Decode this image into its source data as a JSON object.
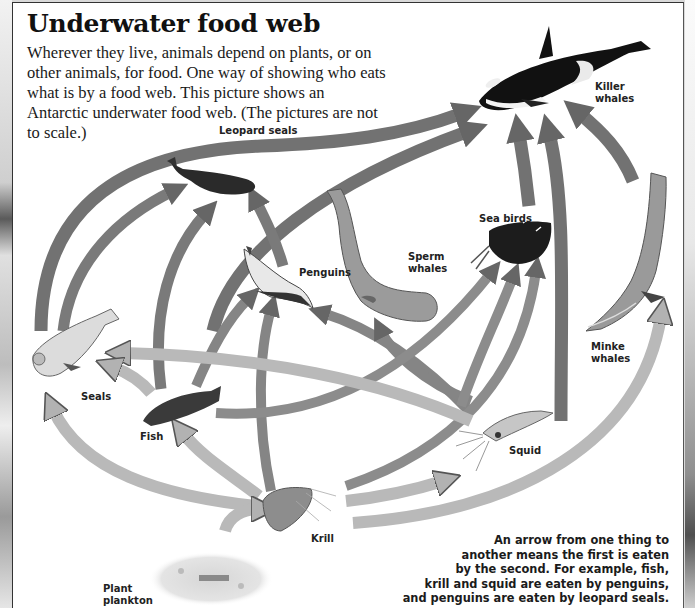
{
  "header": {
    "title": "Underwater food web",
    "intro": "Wherever they live, animals depend on plants, or on other animals, for food. One way of showing who eats what is by a food web. This picture shows an Antarctic underwater food web. (The pictures are not to scale.)"
  },
  "organisms": {
    "killer_whales": {
      "label_line1": "Killer",
      "label_line2": "whales",
      "icon": "killer-whale-icon"
    },
    "leopard_seals": {
      "label": "Leopard seals",
      "icon": "leopard-seal-icon"
    },
    "sea_birds": {
      "label": "Sea birds",
      "icon": "sea-bird-icon"
    },
    "sperm_whales": {
      "label_line1": "Sperm",
      "label_line2": "whales",
      "icon": "sperm-whale-icon"
    },
    "penguins": {
      "label": "Penguins",
      "icon": "penguin-icon"
    },
    "minke_whales": {
      "label_line1": "Minke",
      "label_line2": "whales",
      "icon": "minke-whale-icon"
    },
    "seals": {
      "label": "Seals",
      "icon": "seal-icon"
    },
    "fish": {
      "label": "Fish",
      "icon": "fish-icon"
    },
    "squid": {
      "label": "Squid",
      "icon": "squid-icon"
    },
    "krill": {
      "label": "Krill",
      "icon": "krill-icon"
    },
    "plant_plankton": {
      "label_line1": "Plant",
      "label_line2": "plankton",
      "icon": "plankton-icon"
    }
  },
  "relationships": [
    {
      "from": "Seals",
      "to": "Killer whales"
    },
    {
      "from": "Leopard seals",
      "to": "Killer whales"
    },
    {
      "from": "Sea birds",
      "to": "Killer whales"
    },
    {
      "from": "Sperm whales",
      "to": "Killer whales"
    },
    {
      "from": "Minke whales",
      "to": "Killer whales"
    },
    {
      "from": "Seals",
      "to": "Leopard seals"
    },
    {
      "from": "Fish",
      "to": "Leopard seals"
    },
    {
      "from": "Penguins",
      "to": "Leopard seals"
    },
    {
      "from": "Fish",
      "to": "Penguins"
    },
    {
      "from": "Krill",
      "to": "Penguins"
    },
    {
      "from": "Squid",
      "to": "Penguins"
    },
    {
      "from": "Squid",
      "to": "Sperm whales"
    },
    {
      "from": "Fish",
      "to": "Sea birds"
    },
    {
      "from": "Squid",
      "to": "Sea birds"
    },
    {
      "from": "Krill",
      "to": "Sea birds"
    },
    {
      "from": "Squid",
      "to": "Seals"
    },
    {
      "from": "Fish",
      "to": "Seals"
    },
    {
      "from": "Krill",
      "to": "Seals"
    },
    {
      "from": "Krill",
      "to": "Fish"
    },
    {
      "from": "Krill",
      "to": "Squid"
    },
    {
      "from": "Krill",
      "to": "Minke whales"
    },
    {
      "from": "Plant plankton",
      "to": "Krill"
    }
  ],
  "caption": {
    "line1": "An arrow from one thing to",
    "line2": "another means the first is eaten",
    "line3": "by the second. For example, fish,",
    "line4": "krill and squid are eaten by penguins,",
    "line5": "and penguins are eaten by leopard seals."
  },
  "colors": {
    "arrow_dark": "#6e6e6e",
    "arrow_light": "#b8b8b8",
    "panel_bg": "#ffffff",
    "text": "#111111"
  }
}
